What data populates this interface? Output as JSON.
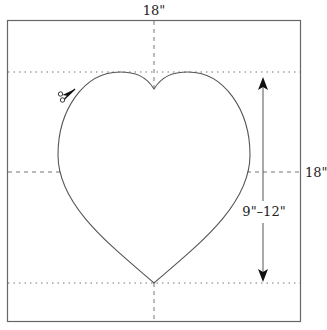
{
  "diagram": {
    "labels": {
      "top_width": "18\"",
      "right_height": "18\"",
      "heart_height": "9\"–12\""
    },
    "icons": {
      "scissors": "scissors-icon",
      "arrow_up": "arrow-up-icon",
      "arrow_down": "arrow-down-icon"
    },
    "colors": {
      "line": "#555555",
      "arrow": "#111111",
      "background": "#ffffff"
    }
  }
}
